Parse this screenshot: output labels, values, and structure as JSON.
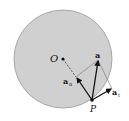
{
  "diagram": {
    "title": "",
    "colors": {
      "disk_fill": "#d0d0d0",
      "disk_stroke": "#a8a8a8",
      "vector": "#111111",
      "helper_line": "#7a7a7a"
    },
    "circle": {
      "cx": 63,
      "cy": 59,
      "r": 49
    },
    "points": {
      "O": {
        "label": "O",
        "x": 63,
        "y": 59
      },
      "P": {
        "label": "P",
        "x": 92,
        "y": 100
      }
    },
    "vectors": [
      {
        "id": "a",
        "label": "a",
        "from": "P",
        "to": [
          98,
          60
        ]
      },
      {
        "id": "a_n",
        "label": "a",
        "subscript": "n",
        "from": "P",
        "to": [
          76,
          77
        ]
      },
      {
        "id": "a_t",
        "label": "a",
        "subscript": "t",
        "from": "P",
        "to": [
          112,
          89
        ]
      }
    ]
  }
}
